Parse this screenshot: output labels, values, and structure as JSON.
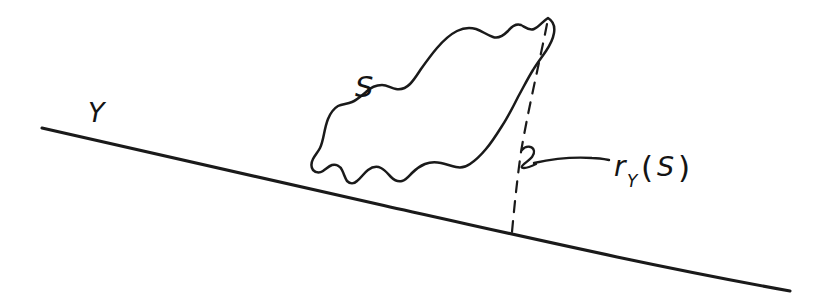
{
  "figure": {
    "kind": "hand-drawn-math-diagram",
    "background_color": "#ffffff",
    "ink_color": "#1a1a1a",
    "width": 834,
    "height": 308
  },
  "labels": {
    "line_label": "Y",
    "set_label": "S",
    "map_base": "r",
    "map_subscript": "Y",
    "map_open_paren": "(",
    "map_argument": "S",
    "map_close_paren": ")",
    "map_label_full": "r_Y(S)"
  },
  "elements": {
    "baseline_name": "line-Y",
    "blob_name": "set-S-blob",
    "dashed_name": "projection-dashed-line",
    "leader_name": "leader-line",
    "hook_name": "leader-hook"
  },
  "geometry": {
    "baseline_start_x": 42,
    "baseline_start_y": 128,
    "baseline_end_x": 790,
    "baseline_end_y": 290,
    "dashed_top_x": 548,
    "dashed_top_y": 24,
    "dashed_bottom_x": 512,
    "dashed_bottom_y": 232,
    "blob_peak_x": 548,
    "blob_peak_y": 18,
    "leader_start_x": 534,
    "leader_end_x": 608,
    "leader_y": 160
  }
}
